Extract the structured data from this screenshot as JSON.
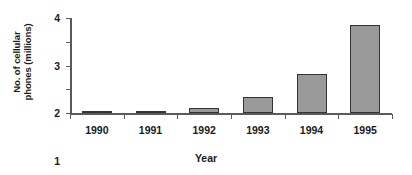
{
  "chart_data": {
    "type": "bar",
    "title": "",
    "xlabel": "Year",
    "ylabel": "No. of cellular\nphones (millions)",
    "categories": [
      "1990",
      "1991",
      "1992",
      "1993",
      "1994",
      "1995"
    ],
    "values": [
      0.0,
      0.06,
      0.2,
      0.68,
      1.63,
      3.72
    ],
    "ylim": [
      0,
      4
    ],
    "yticks": [
      0,
      1,
      2,
      3,
      4
    ],
    "ytick_labels": [
      "0",
      "1",
      "2",
      "3",
      "4"
    ],
    "grid": false,
    "legend": false,
    "series": [
      {
        "name": "No. of cellular phones (millions)",
        "values": [
          0.0,
          0.06,
          0.2,
          0.68,
          1.63,
          3.72
        ]
      }
    ],
    "colors": {
      "bar_fill": "#9a9a9a",
      "bar_border": "#333333",
      "axis": "#5a5a5a",
      "text": "#1a1a1a",
      "background": "#ffffff"
    }
  }
}
